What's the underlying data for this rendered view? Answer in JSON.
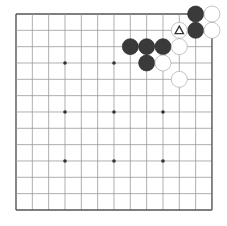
{
  "board": {
    "size": 13,
    "origin_x": 16,
    "origin_y": 14,
    "spacing": 16.33,
    "line_color": "#9a9a9a",
    "border_color": "#555555",
    "star_color": "#333333",
    "star_points": [
      [
        3,
        3
      ],
      [
        6,
        3
      ],
      [
        3,
        6
      ],
      [
        6,
        6
      ],
      [
        9,
        6
      ],
      [
        3,
        9
      ],
      [
        6,
        9
      ],
      [
        9,
        9
      ]
    ]
  },
  "stones": {
    "black_color": "#3a3a3a",
    "white_color": "#ffffff",
    "black": [
      [
        11,
        0
      ],
      [
        11,
        1
      ],
      [
        7,
        2
      ],
      [
        8,
        2
      ],
      [
        9,
        2
      ],
      [
        8,
        3
      ]
    ],
    "white": [
      [
        12,
        0
      ],
      [
        12,
        1
      ],
      [
        10,
        1
      ],
      [
        10,
        2
      ],
      [
        9,
        3
      ],
      [
        10,
        4
      ]
    ]
  },
  "markers": [
    {
      "type": "triangle",
      "col": 10,
      "row": 1,
      "symbol": "△"
    }
  ]
}
